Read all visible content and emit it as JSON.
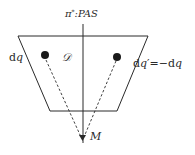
{
  "diagram": {
    "colors": {
      "stroke": "#2a2a2a",
      "background": "#ffffff",
      "dot": "#1a1a1a"
    },
    "axis_label": {
      "pi": "π",
      "sup": "*",
      "rest": ":PAS"
    },
    "region_label": "𝒟",
    "left_label": {
      "d": "d",
      "q": "q"
    },
    "right_label": {
      "d": "d",
      "q": "q",
      "prime": "′",
      "eq": "=−d",
      "q2": "q"
    },
    "point_label": "M",
    "shape": {
      "trapezoid": [
        [
          18,
          36
        ],
        [
          148,
          36
        ],
        [
          117,
          111
        ],
        [
          50,
          111
        ]
      ],
      "axis": {
        "x": 83,
        "y1": 24,
        "y2": 143
      },
      "left_dot": {
        "cx": 45,
        "cy": 55,
        "r": 4
      },
      "right_dot": {
        "cx": 117,
        "cy": 57,
        "r": 4
      },
      "apex": {
        "x": 82,
        "y": 140
      }
    }
  }
}
